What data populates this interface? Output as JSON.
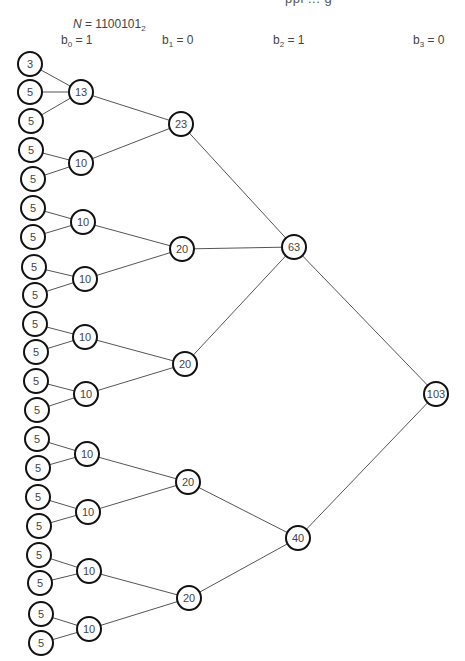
{
  "header": {
    "cutoff_text": "ppl  ...  g",
    "n_label": {
      "var": "N",
      "eq": " = ",
      "value": "1100101",
      "base": "2"
    },
    "bits": [
      {
        "name": "b",
        "index": "0",
        "eq": " = ",
        "value": "1",
        "x": 61,
        "y": 33
      },
      {
        "name": "b",
        "index": "1",
        "eq": " = ",
        "value": "0",
        "x": 162,
        "y": 33
      },
      {
        "name": "b",
        "index": "2",
        "eq": " = ",
        "value": "1",
        "x": 273,
        "y": 33
      },
      {
        "name": "b",
        "index": "3",
        "eq": " = ",
        "value": "0",
        "x": 413,
        "y": 33
      }
    ]
  },
  "tree": {
    "node_radius": 12,
    "stroke_color": "#111111",
    "edge_color": "#555555",
    "nodes": [
      {
        "id": "L1",
        "label": "3",
        "x": 30,
        "y": 64
      },
      {
        "id": "L2",
        "label": "5",
        "x": 30,
        "y": 92
      },
      {
        "id": "L3",
        "label": "5",
        "x": 31,
        "y": 121
      },
      {
        "id": "L4",
        "label": "5",
        "x": 31,
        "y": 150
      },
      {
        "id": "L5",
        "label": "5",
        "x": 33,
        "y": 179
      },
      {
        "id": "L6",
        "label": "5",
        "x": 33,
        "y": 208
      },
      {
        "id": "L7",
        "label": "5",
        "x": 33,
        "y": 237
      },
      {
        "id": "L8",
        "label": "5",
        "x": 34,
        "y": 267
      },
      {
        "id": "L9",
        "label": "5",
        "x": 35,
        "y": 295
      },
      {
        "id": "L10",
        "label": "5",
        "x": 35,
        "y": 324
      },
      {
        "id": "L11",
        "label": "5",
        "x": 36,
        "y": 352
      },
      {
        "id": "L12",
        "label": "5",
        "x": 36,
        "y": 381
      },
      {
        "id": "L13",
        "label": "5",
        "x": 37,
        "y": 410
      },
      {
        "id": "L14",
        "label": "5",
        "x": 37,
        "y": 439
      },
      {
        "id": "L15",
        "label": "5",
        "x": 38,
        "y": 468
      },
      {
        "id": "L16",
        "label": "5",
        "x": 38,
        "y": 497
      },
      {
        "id": "L17",
        "label": "5",
        "x": 39,
        "y": 526
      },
      {
        "id": "L18",
        "label": "5",
        "x": 39,
        "y": 555
      },
      {
        "id": "L19",
        "label": "5",
        "x": 40,
        "y": 583
      },
      {
        "id": "L20",
        "label": "5",
        "x": 41,
        "y": 614
      },
      {
        "id": "L21",
        "label": "5",
        "x": 41,
        "y": 643
      },
      {
        "id": "A1",
        "label": "13",
        "x": 81,
        "y": 92
      },
      {
        "id": "A2",
        "label": "10",
        "x": 81,
        "y": 163
      },
      {
        "id": "A3",
        "label": "10",
        "x": 83,
        "y": 222
      },
      {
        "id": "A4",
        "label": "10",
        "x": 85,
        "y": 279
      },
      {
        "id": "A5",
        "label": "10",
        "x": 85,
        "y": 337
      },
      {
        "id": "A6",
        "label": "10",
        "x": 86,
        "y": 394
      },
      {
        "id": "A7",
        "label": "10",
        "x": 87,
        "y": 454
      },
      {
        "id": "A8",
        "label": "10",
        "x": 88,
        "y": 512
      },
      {
        "id": "A9",
        "label": "10",
        "x": 89,
        "y": 571
      },
      {
        "id": "A10",
        "label": "10",
        "x": 89,
        "y": 629
      },
      {
        "id": "B1",
        "label": "23",
        "x": 181,
        "y": 124
      },
      {
        "id": "B2",
        "label": "20",
        "x": 182,
        "y": 249
      },
      {
        "id": "B3",
        "label": "20",
        "x": 185,
        "y": 364
      },
      {
        "id": "B4",
        "label": "20",
        "x": 188,
        "y": 482
      },
      {
        "id": "B5",
        "label": "20",
        "x": 189,
        "y": 598
      },
      {
        "id": "C1",
        "label": "63",
        "x": 294,
        "y": 247
      },
      {
        "id": "C2",
        "label": "40",
        "x": 298,
        "y": 538
      },
      {
        "id": "D1",
        "label": "103",
        "x": 436,
        "y": 394
      }
    ],
    "edges": [
      [
        "L1",
        "A1"
      ],
      [
        "L2",
        "A1"
      ],
      [
        "L3",
        "A1"
      ],
      [
        "L4",
        "A2"
      ],
      [
        "L5",
        "A2"
      ],
      [
        "L6",
        "A3"
      ],
      [
        "L7",
        "A3"
      ],
      [
        "L8",
        "A4"
      ],
      [
        "L9",
        "A4"
      ],
      [
        "L10",
        "A5"
      ],
      [
        "L11",
        "A5"
      ],
      [
        "L12",
        "A6"
      ],
      [
        "L13",
        "A6"
      ],
      [
        "L14",
        "A7"
      ],
      [
        "L15",
        "A7"
      ],
      [
        "L16",
        "A8"
      ],
      [
        "L17",
        "A8"
      ],
      [
        "L18",
        "A9"
      ],
      [
        "L19",
        "A9"
      ],
      [
        "L20",
        "A10"
      ],
      [
        "L21",
        "A10"
      ],
      [
        "A1",
        "B1"
      ],
      [
        "A2",
        "B1"
      ],
      [
        "A3",
        "B2"
      ],
      [
        "A4",
        "B2"
      ],
      [
        "A5",
        "B3"
      ],
      [
        "A6",
        "B3"
      ],
      [
        "A7",
        "B4"
      ],
      [
        "A8",
        "B4"
      ],
      [
        "A9",
        "B5"
      ],
      [
        "A10",
        "B5"
      ],
      [
        "B1",
        "C1"
      ],
      [
        "B2",
        "C1"
      ],
      [
        "B3",
        "C1"
      ],
      [
        "B4",
        "C2"
      ],
      [
        "B5",
        "C2"
      ],
      [
        "C1",
        "D1"
      ],
      [
        "C2",
        "D1"
      ]
    ]
  }
}
